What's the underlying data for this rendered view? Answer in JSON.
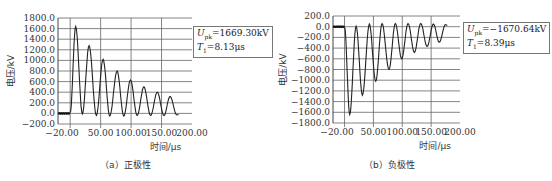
{
  "chart_data": [
    {
      "type": "line",
      "title": "",
      "caption": "（a）正极性",
      "xlabel": "时间/μs",
      "ylabel": "电压/kV",
      "xlim": [
        -20,
        200
      ],
      "ylim": [
        -200,
        1800
      ],
      "xticks": [
        "-20.00",
        "50.00",
        "100.00",
        "150.00",
        "200.00"
      ],
      "yticks": [
        "1800.0",
        "1600.0",
        "1400.0",
        "1200.0",
        "1000.0",
        "800.0",
        "600.0",
        "400.0",
        "200.0",
        "0.0",
        "-200.0"
      ],
      "grid": true,
      "annotation": {
        "U_label": "U",
        "U_sub": "pk",
        "U_value": "=1669.30kV",
        "T_label": "T",
        "T_sub": "1",
        "T_value": "=8.13μs"
      },
      "peaks": [
        {
          "x": 9,
          "y": 1640
        },
        {
          "x": 31,
          "y": 1280
        },
        {
          "x": 54,
          "y": 1020
        },
        {
          "x": 77,
          "y": 800
        },
        {
          "x": 99,
          "y": 630
        },
        {
          "x": 121,
          "y": 500
        },
        {
          "x": 143,
          "y": 400
        },
        {
          "x": 164,
          "y": 320
        }
      ],
      "troughs": [
        {
          "x": 20,
          "y": -10
        },
        {
          "x": 43,
          "y": -40
        },
        {
          "x": 65,
          "y": -50
        },
        {
          "x": 88,
          "y": -50
        },
        {
          "x": 110,
          "y": -40
        },
        {
          "x": 132,
          "y": -40
        },
        {
          "x": 154,
          "y": -40
        },
        {
          "x": 175,
          "y": -30
        }
      ],
      "series": [
        {
          "name": "voltage",
          "color": "#222222"
        }
      ]
    },
    {
      "type": "line",
      "title": "",
      "caption": "（b）负极性",
      "xlabel": "时间/μs",
      "ylabel": "电压/kV",
      "xlim": [
        -20,
        200
      ],
      "ylim": [
        -1800,
        200
      ],
      "xticks": [
        "-20.00",
        "50.00",
        "100.00",
        "150.00",
        "200.00"
      ],
      "yticks": [
        "200.0",
        "0.0",
        "-200.0",
        "-400.0",
        "-600.0",
        "-800.0",
        "-1000.0",
        "-1200.0",
        "-1400.0",
        "-1600.0",
        "-1800.0"
      ],
      "grid": true,
      "annotation": {
        "U_label": "U",
        "U_sub": "pk",
        "U_value": "=−1670.64kV",
        "T_label": "T",
        "T_sub": "1",
        "T_value": "=8.39μs"
      },
      "peaks": [
        {
          "x": 9,
          "y": -1640
        },
        {
          "x": 31,
          "y": -1280
        },
        {
          "x": 54,
          "y": -1020
        },
        {
          "x": 77,
          "y": -800
        },
        {
          "x": 99,
          "y": -600
        },
        {
          "x": 121,
          "y": -480
        },
        {
          "x": 143,
          "y": -370
        },
        {
          "x": 164,
          "y": -290
        }
      ],
      "troughs": [
        {
          "x": 20,
          "y": 10
        },
        {
          "x": 43,
          "y": 50
        },
        {
          "x": 65,
          "y": 60
        },
        {
          "x": 88,
          "y": 60
        },
        {
          "x": 110,
          "y": 60
        },
        {
          "x": 132,
          "y": 60
        },
        {
          "x": 154,
          "y": 50
        },
        {
          "x": 175,
          "y": 40
        }
      ],
      "series": [
        {
          "name": "voltage",
          "color": "#222222"
        }
      ]
    }
  ]
}
